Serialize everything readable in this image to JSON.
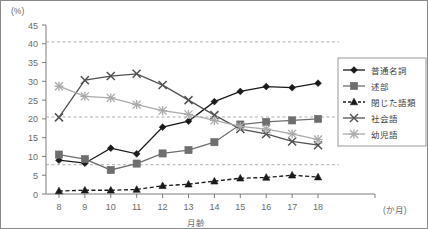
{
  "chart_data": {
    "type": "line",
    "title": "",
    "xlabel": "月齢",
    "ylabel": "",
    "y_unit_label": "(%)",
    "x_unit_label": "(か月)",
    "x": [
      8,
      9,
      10,
      11,
      12,
      13,
      14,
      15,
      16,
      17,
      18
    ],
    "xlim": [
      7.5,
      18.5
    ],
    "ylim": [
      0,
      45
    ],
    "y_ticks": [
      0,
      5,
      10,
      15,
      20,
      25,
      30,
      35,
      40,
      45
    ],
    "x_ticks": [
      8,
      9,
      10,
      11,
      12,
      13,
      14,
      15,
      16,
      17,
      18
    ],
    "grid": false,
    "reference_lines": [
      40.5,
      20.5,
      7.8
    ],
    "legend_position": "right",
    "series": [
      {
        "name": "普通名詞",
        "marker": "diamond",
        "color": "#1a1a1a",
        "line_style": "solid",
        "values": [
          9.0,
          8.2,
          12.2,
          10.7,
          17.8,
          19.4,
          24.6,
          27.3,
          28.6,
          28.3,
          29.5
        ]
      },
      {
        "name": "述部",
        "marker": "square",
        "color": "#6e6e6e",
        "line_style": "solid",
        "values": [
          10.5,
          9.3,
          6.4,
          8.1,
          10.8,
          11.7,
          13.8,
          18.5,
          19.2,
          19.6,
          20.0
        ]
      },
      {
        "name": "閉じた語類",
        "marker": "triangle",
        "color": "#1a1a1a",
        "line_style": "dashed",
        "values": [
          0.8,
          1.0,
          1.0,
          1.2,
          2.2,
          2.6,
          3.4,
          4.2,
          4.4,
          5.0,
          4.5
        ]
      },
      {
        "name": "社会語",
        "marker": "x",
        "color": "#525252",
        "line_style": "solid",
        "values": [
          20.4,
          30.3,
          31.4,
          32.0,
          29.0,
          25.0,
          21.0,
          17.3,
          16.0,
          14.0,
          13.0
        ]
      },
      {
        "name": "幼児語",
        "marker": "asterisk",
        "color": "#aaaaaa",
        "line_style": "solid",
        "values": [
          28.7,
          26.0,
          25.6,
          23.8,
          22.2,
          21.2,
          19.6,
          18.0,
          17.3,
          16.0,
          14.5
        ]
      }
    ]
  },
  "legend": {
    "entries": [
      {
        "label": "普通名詞"
      },
      {
        "label": "述部"
      },
      {
        "label": "閉じた語類"
      },
      {
        "label": "社会語"
      },
      {
        "label": "幼児語"
      }
    ]
  },
  "axes": {
    "y_unit": "(%)",
    "x_unit": "(か月)",
    "x_title": "月齢",
    "y_tick_labels": [
      "45",
      "40",
      "35",
      "30",
      "25",
      "20",
      "15",
      "10",
      "5",
      "0"
    ],
    "x_tick_labels": [
      "8",
      "9",
      "10",
      "11",
      "12",
      "13",
      "14",
      "15",
      "16",
      "17",
      "18"
    ]
  }
}
